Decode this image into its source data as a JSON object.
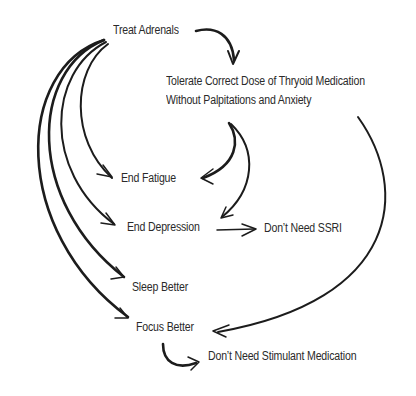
{
  "diagram": {
    "type": "flow",
    "nodes": {
      "treat_adrenals": "Treat Adrenals",
      "tolerate_line1": "Tolerate Correct Dose of Thryoid Medication",
      "tolerate_line2": "Without Palpitations and Anxiety",
      "end_fatigue": "End Fatigue",
      "end_depression": "End Depression",
      "dont_need_ssri": "Don’t Need SSRI",
      "sleep_better": "Sleep Better",
      "focus_better": "Focus Better",
      "dont_need_stimulant": "Don’t Need Stimulant Medication"
    },
    "edges": [
      {
        "from": "Treat Adrenals",
        "to": "Tolerate Correct Dose of Thryoid Medication Without Palpitations and Anxiety"
      },
      {
        "from": "Treat Adrenals",
        "to": "End Fatigue"
      },
      {
        "from": "Treat Adrenals",
        "to": "End Depression"
      },
      {
        "from": "Treat Adrenals",
        "to": "Sleep Better"
      },
      {
        "from": "Treat Adrenals",
        "to": "Focus Better"
      },
      {
        "from": "Tolerate Correct Dose of Thryoid Medication Without Palpitations and Anxiety",
        "to": "End Fatigue"
      },
      {
        "from": "Tolerate Correct Dose of Thryoid Medication Without Palpitations and Anxiety",
        "to": "End Depression"
      },
      {
        "from": "Tolerate Correct Dose of Thryoid Medication Without Palpitations and Anxiety",
        "to": "Focus Better"
      },
      {
        "from": "End Depression",
        "to": "Don’t Need SSRI"
      },
      {
        "from": "Focus Better",
        "to": "Don’t Need Stimulant Medication"
      }
    ],
    "colors": {
      "ink": "#1c1c1c",
      "text": "#2a2a2a",
      "background": "#ffffff"
    }
  }
}
